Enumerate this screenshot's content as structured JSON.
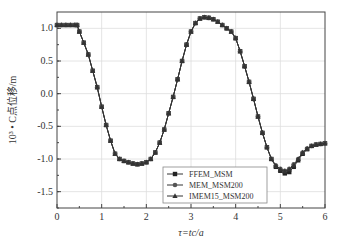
{
  "chart_data": {
    "type": "line",
    "title": "",
    "xlabel": "τ=tc/a",
    "ylabel": "10³ • C点位移/m",
    "xlim": [
      0,
      6
    ],
    "ylim": [
      -1.75,
      1.25
    ],
    "xticks": [
      "0",
      "1",
      "2",
      "3",
      "4",
      "5",
      "6"
    ],
    "yticks": [
      "1.0",
      "0.5",
      "0.0",
      "-0.5",
      "-1.0",
      "-1.5"
    ],
    "grid": true,
    "legend_position": "lower right",
    "x": [
      0,
      0.1,
      0.2,
      0.3,
      0.4,
      0.45,
      0.5,
      0.6,
      0.7,
      0.8,
      0.9,
      1.0,
      1.1,
      1.2,
      1.3,
      1.4,
      1.5,
      1.6,
      1.7,
      1.8,
      1.9,
      2.0,
      2.1,
      2.2,
      2.3,
      2.4,
      2.5,
      2.6,
      2.7,
      2.8,
      2.9,
      3.0,
      3.1,
      3.2,
      3.3,
      3.4,
      3.5,
      3.6,
      3.7,
      3.8,
      3.9,
      4.0,
      4.1,
      4.2,
      4.3,
      4.4,
      4.5,
      4.6,
      4.7,
      4.8,
      4.9,
      5.0,
      5.1,
      5.2,
      5.3,
      5.4,
      5.5,
      5.6,
      5.7,
      5.8,
      5.9,
      6.0
    ],
    "series": [
      {
        "name": "FFEM_MSM",
        "marker": "square",
        "values": [
          1.05,
          1.05,
          1.05,
          1.05,
          1.05,
          1.05,
          0.95,
          0.78,
          0.6,
          0.35,
          0.1,
          -0.2,
          -0.48,
          -0.72,
          -0.92,
          -1.0,
          -1.03,
          -1.05,
          -1.07,
          -1.08,
          -1.07,
          -1.05,
          -1.0,
          -0.9,
          -0.75,
          -0.55,
          -0.3,
          -0.05,
          0.22,
          0.5,
          0.75,
          0.95,
          1.08,
          1.15,
          1.17,
          1.16,
          1.14,
          1.1,
          1.05,
          1.0,
          0.95,
          0.85,
          0.65,
          0.42,
          0.18,
          -0.08,
          -0.35,
          -0.6,
          -0.82,
          -1.0,
          -1.12,
          -1.18,
          -1.22,
          -1.2,
          -1.12,
          -1.02,
          -0.92,
          -0.85,
          -0.8,
          -0.78,
          -0.77,
          -0.76
        ]
      },
      {
        "name": "MEM_MSM200",
        "marker": "circle",
        "values": [
          1.05,
          1.05,
          1.05,
          1.05,
          1.05,
          1.05,
          0.95,
          0.78,
          0.6,
          0.35,
          0.1,
          -0.2,
          -0.48,
          -0.72,
          -0.92,
          -1.0,
          -1.03,
          -1.05,
          -1.07,
          -1.08,
          -1.07,
          -1.05,
          -1.0,
          -0.9,
          -0.75,
          -0.55,
          -0.3,
          -0.05,
          0.22,
          0.5,
          0.75,
          0.95,
          1.08,
          1.15,
          1.17,
          1.16,
          1.14,
          1.1,
          1.05,
          1.0,
          0.95,
          0.85,
          0.65,
          0.42,
          0.18,
          -0.08,
          -0.35,
          -0.6,
          -0.82,
          -1.0,
          -1.1,
          -1.15,
          -1.18,
          -1.15,
          -1.08,
          -1.0,
          -0.9,
          -0.84,
          -0.8,
          -0.78,
          -0.77,
          -0.76
        ]
      },
      {
        "name": "IMEM15_MSM200",
        "marker": "triangle",
        "values": [
          1.05,
          1.05,
          1.05,
          1.05,
          1.05,
          1.05,
          0.95,
          0.78,
          0.6,
          0.35,
          0.1,
          -0.2,
          -0.48,
          -0.72,
          -0.92,
          -1.0,
          -1.03,
          -1.05,
          -1.07,
          -1.08,
          -1.07,
          -1.05,
          -1.0,
          -0.9,
          -0.75,
          -0.55,
          -0.3,
          -0.05,
          0.22,
          0.5,
          0.75,
          0.95,
          1.08,
          1.15,
          1.17,
          1.16,
          1.14,
          1.1,
          1.05,
          1.0,
          0.95,
          0.85,
          0.65,
          0.42,
          0.18,
          -0.08,
          -0.35,
          -0.6,
          -0.82,
          -1.0,
          -1.1,
          -1.16,
          -1.19,
          -1.16,
          -1.1,
          -1.0,
          -0.9,
          -0.84,
          -0.8,
          -0.78,
          -0.77,
          -0.76
        ]
      }
    ]
  }
}
